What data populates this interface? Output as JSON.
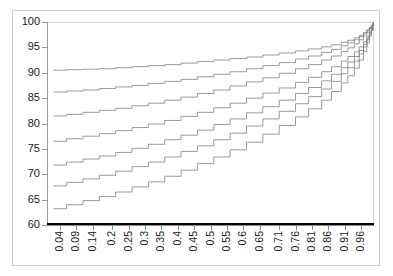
{
  "chart_data": {
    "type": "line",
    "title": "",
    "subtitle": "",
    "xlabel": "",
    "ylabel": "",
    "xlim": [
      0.0,
      1.0
    ],
    "ylim": [
      60,
      100
    ],
    "grid": false,
    "legend": "none",
    "annotations": [],
    "y_ticks": [
      60,
      65,
      70,
      75,
      80,
      85,
      90,
      95,
      100
    ],
    "x_ticks": [
      "0.04",
      "0.09",
      "0.14",
      "0.2",
      "0.25",
      "0.3",
      "0.35",
      "0.4",
      "0.45",
      "0.5",
      "0.55",
      "0.6",
      "0.65",
      "0.71",
      "0.76",
      "0.81",
      "0.86",
      "0.91",
      "0.96"
    ],
    "x_tick_values": [
      0.04,
      0.09,
      0.14,
      0.2,
      0.25,
      0.3,
      0.35,
      0.4,
      0.45,
      0.5,
      0.55,
      0.6,
      0.65,
      0.71,
      0.76,
      0.81,
      0.86,
      0.91,
      0.96
    ],
    "step_shape": "hv",
    "series_color_thin": "#808080",
    "series_color_thick": "#000000",
    "series": [
      {
        "name": "curve-1",
        "style": "step-thin",
        "start": 90.5,
        "end": 100.0,
        "x": [
          0.02,
          0.06,
          0.11,
          0.16,
          0.21,
          0.26,
          0.31,
          0.36,
          0.41,
          0.46,
          0.51,
          0.56,
          0.61,
          0.66,
          0.71,
          0.76,
          0.8,
          0.84,
          0.87,
          0.9,
          0.92,
          0.94,
          0.955,
          0.968,
          0.978,
          0.986,
          0.992,
          0.996,
          0.999
        ],
        "values": [
          90.5,
          90.6,
          90.7,
          90.8,
          91.0,
          91.2,
          91.4,
          91.6,
          91.9,
          92.2,
          92.5,
          92.8,
          93.1,
          93.5,
          93.9,
          94.3,
          94.7,
          95.1,
          95.5,
          96.0,
          96.4,
          96.9,
          97.4,
          97.9,
          98.4,
          98.9,
          99.3,
          99.7,
          100.0
        ]
      },
      {
        "name": "curve-2",
        "style": "step-thin",
        "start": 86.2,
        "end": 100.0,
        "x": [
          0.02,
          0.06,
          0.11,
          0.16,
          0.21,
          0.26,
          0.31,
          0.36,
          0.41,
          0.46,
          0.51,
          0.56,
          0.61,
          0.66,
          0.71,
          0.76,
          0.8,
          0.84,
          0.87,
          0.9,
          0.92,
          0.94,
          0.955,
          0.968,
          0.978,
          0.986,
          0.992,
          0.996,
          0.999
        ],
        "values": [
          86.2,
          86.4,
          86.6,
          86.9,
          87.2,
          87.5,
          87.9,
          88.3,
          88.7,
          89.2,
          89.7,
          90.2,
          90.8,
          91.4,
          92.0,
          92.7,
          93.3,
          94.0,
          94.6,
          95.3,
          95.9,
          96.5,
          97.1,
          97.8,
          98.4,
          98.9,
          99.3,
          99.7,
          100.0
        ]
      },
      {
        "name": "curve-3",
        "style": "step-thin",
        "start": 81.5,
        "end": 100.0,
        "x": [
          0.02,
          0.06,
          0.11,
          0.16,
          0.21,
          0.26,
          0.31,
          0.36,
          0.41,
          0.46,
          0.51,
          0.56,
          0.61,
          0.66,
          0.71,
          0.76,
          0.8,
          0.84,
          0.87,
          0.9,
          0.92,
          0.94,
          0.955,
          0.968,
          0.978,
          0.986,
          0.992,
          0.996,
          0.999
        ],
        "values": [
          81.5,
          81.8,
          82.2,
          82.6,
          83.0,
          83.5,
          84.0,
          84.6,
          85.2,
          85.9,
          86.6,
          87.4,
          88.2,
          89.0,
          89.9,
          90.8,
          91.6,
          92.5,
          93.3,
          94.2,
          94.9,
          95.7,
          96.5,
          97.3,
          98.0,
          98.7,
          99.2,
          99.6,
          100.0
        ]
      },
      {
        "name": "curve-4",
        "style": "step-thin",
        "start": 76.5,
        "end": 100.0,
        "x": [
          0.02,
          0.06,
          0.11,
          0.16,
          0.21,
          0.26,
          0.31,
          0.36,
          0.41,
          0.46,
          0.51,
          0.56,
          0.61,
          0.66,
          0.71,
          0.76,
          0.8,
          0.84,
          0.87,
          0.9,
          0.92,
          0.94,
          0.955,
          0.968,
          0.978,
          0.986,
          0.992,
          0.996,
          0.999
        ],
        "values": [
          76.5,
          77.0,
          77.5,
          78.0,
          78.6,
          79.2,
          79.9,
          80.6,
          81.4,
          82.2,
          83.1,
          84.0,
          85.0,
          86.0,
          87.0,
          88.1,
          89.1,
          90.2,
          91.2,
          92.3,
          93.2,
          94.1,
          95.1,
          96.1,
          97.1,
          98.0,
          98.7,
          99.4,
          100.0
        ]
      },
      {
        "name": "curve-5",
        "style": "step-thin",
        "start": 71.8,
        "end": 100.0,
        "x": [
          0.02,
          0.06,
          0.11,
          0.16,
          0.21,
          0.26,
          0.31,
          0.36,
          0.41,
          0.46,
          0.51,
          0.56,
          0.61,
          0.66,
          0.71,
          0.76,
          0.8,
          0.84,
          0.87,
          0.9,
          0.92,
          0.94,
          0.955,
          0.968,
          0.978,
          0.986,
          0.992,
          0.996,
          0.999
        ],
        "values": [
          71.8,
          72.4,
          73.0,
          73.6,
          74.3,
          75.1,
          75.9,
          76.8,
          77.7,
          78.7,
          79.8,
          80.9,
          82.1,
          83.3,
          84.6,
          85.9,
          87.1,
          88.4,
          89.7,
          91.0,
          92.1,
          93.2,
          94.4,
          95.6,
          96.8,
          97.8,
          98.6,
          99.3,
          100.0
        ]
      },
      {
        "name": "curve-6",
        "style": "step-thin",
        "start": 67.7,
        "end": 100.0,
        "x": [
          0.02,
          0.06,
          0.11,
          0.16,
          0.21,
          0.26,
          0.31,
          0.36,
          0.41,
          0.46,
          0.51,
          0.56,
          0.61,
          0.66,
          0.71,
          0.76,
          0.8,
          0.84,
          0.87,
          0.9,
          0.92,
          0.94,
          0.955,
          0.968,
          0.978,
          0.986,
          0.992,
          0.996,
          0.999
        ],
        "values": [
          67.7,
          68.4,
          69.1,
          69.8,
          70.6,
          71.5,
          72.4,
          73.4,
          74.5,
          75.6,
          76.8,
          78.1,
          79.5,
          80.9,
          82.4,
          83.9,
          85.3,
          86.8,
          88.3,
          89.8,
          91.0,
          92.3,
          93.7,
          95.1,
          96.5,
          97.6,
          98.5,
          99.3,
          100.0
        ]
      },
      {
        "name": "curve-7",
        "style": "step-thin",
        "start": 63.2,
        "end": 100.0,
        "x": [
          0.02,
          0.06,
          0.11,
          0.16,
          0.21,
          0.26,
          0.31,
          0.36,
          0.41,
          0.46,
          0.51,
          0.56,
          0.61,
          0.66,
          0.71,
          0.76,
          0.8,
          0.84,
          0.87,
          0.9,
          0.92,
          0.94,
          0.955,
          0.968,
          0.978,
          0.986,
          0.992,
          0.996,
          0.999
        ],
        "values": [
          63.2,
          64.0,
          64.8,
          65.6,
          66.5,
          67.5,
          68.5,
          69.6,
          70.8,
          72.1,
          73.4,
          74.8,
          76.3,
          77.9,
          79.6,
          81.3,
          82.9,
          84.6,
          86.3,
          88.0,
          89.4,
          90.9,
          92.5,
          94.2,
          95.9,
          97.2,
          98.3,
          99.2,
          100.0
        ]
      },
      {
        "name": "baseline-thick",
        "style": "line-thick",
        "start": 60.0,
        "end": 60.0,
        "x": [
          0.0,
          1.0
        ],
        "values": [
          60.0,
          60.0
        ]
      }
    ]
  }
}
